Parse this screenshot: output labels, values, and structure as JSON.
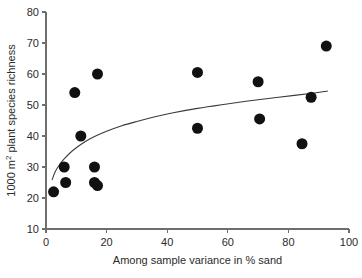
{
  "chart_data": {
    "type": "scatter",
    "title": "",
    "xlabel": "Among sample variance in % sand",
    "ylabel": "1000 m2 plant species richness",
    "ylabel_prefix": "1000 m",
    "ylabel_superscript": "2",
    "ylabel_suffix": " plant species richness",
    "xlim": [
      0,
      100
    ],
    "ylim": [
      10,
      80
    ],
    "xticks": [
      0,
      20,
      40,
      60,
      80,
      100
    ],
    "yticks": [
      10,
      20,
      30,
      40,
      50,
      60,
      70,
      80
    ],
    "xtick_labels": [
      "0",
      "20",
      "40",
      "60",
      "80",
      "100"
    ],
    "ytick_labels": [
      "10",
      "20",
      "30",
      "40",
      "50",
      "60",
      "70",
      "80"
    ],
    "grid": false,
    "legend": false,
    "marker": "filled-circle",
    "marker_color": "#111111",
    "marker_size_px": 11,
    "points": [
      {
        "x": 2.5,
        "y": 22.0
      },
      {
        "x": 6.0,
        "y": 30.0
      },
      {
        "x": 6.5,
        "y": 25.0
      },
      {
        "x": 9.5,
        "y": 54.0
      },
      {
        "x": 11.5,
        "y": 40.0
      },
      {
        "x": 16.0,
        "y": 30.0
      },
      {
        "x": 16.0,
        "y": 25.0
      },
      {
        "x": 17.0,
        "y": 24.0
      },
      {
        "x": 17.0,
        "y": 60.0
      },
      {
        "x": 50.0,
        "y": 60.5
      },
      {
        "x": 50.0,
        "y": 42.5
      },
      {
        "x": 70.0,
        "y": 57.5
      },
      {
        "x": 70.5,
        "y": 45.5
      },
      {
        "x": 84.5,
        "y": 37.5
      },
      {
        "x": 87.5,
        "y": 52.5
      },
      {
        "x": 92.5,
        "y": 69.0
      }
    ],
    "fit_curve": {
      "name": "logarithmic fit",
      "color": "#3a3a3a",
      "x_start": 2.0,
      "x_end": 93.0,
      "points": [
        {
          "x": 2.0,
          "y": 25.8
        },
        {
          "x": 3.0,
          "y": 28.4
        },
        {
          "x": 4.5,
          "y": 30.8
        },
        {
          "x": 6.0,
          "y": 32.6
        },
        {
          "x": 8.0,
          "y": 34.6
        },
        {
          "x": 10.0,
          "y": 36.2
        },
        {
          "x": 13.0,
          "y": 38.2
        },
        {
          "x": 16.0,
          "y": 39.8
        },
        {
          "x": 20.0,
          "y": 41.5
        },
        {
          "x": 25.0,
          "y": 43.3
        },
        {
          "x": 30.0,
          "y": 44.7
        },
        {
          "x": 36.0,
          "y": 46.2
        },
        {
          "x": 42.0,
          "y": 47.5
        },
        {
          "x": 50.0,
          "y": 48.9
        },
        {
          "x": 58.0,
          "y": 50.1
        },
        {
          "x": 66.0,
          "y": 51.2
        },
        {
          "x": 74.0,
          "y": 52.2
        },
        {
          "x": 82.0,
          "y": 53.1
        },
        {
          "x": 88.0,
          "y": 53.8
        },
        {
          "x": 93.0,
          "y": 54.5
        }
      ]
    }
  },
  "axes": {
    "x_axis_name": "x-axis",
    "y_axis_name": "y-axis"
  }
}
